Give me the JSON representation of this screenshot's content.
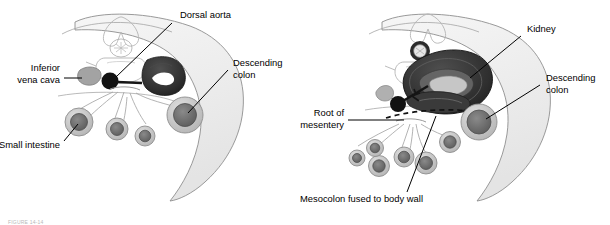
{
  "figure": {
    "caption": "FIGURE 14-14",
    "panels": [
      {
        "id": "left",
        "name": "pre-fusion-cross-section",
        "labels": [
          {
            "name": "dorsal-aorta",
            "text": "Dorsal aorta",
            "line1": "Dorsal aorta",
            "line2": ""
          },
          {
            "name": "inferior-vena-cava",
            "text": "Inferior vena cava",
            "line1": "Inferior",
            "line2": "vena cava"
          },
          {
            "name": "descending-colon",
            "text": "Descending colon",
            "line1": "Descending",
            "line2": "colon"
          },
          {
            "name": "small-intestine",
            "text": "Small intestine",
            "line1": "Small intestine",
            "line2": ""
          }
        ]
      },
      {
        "id": "right",
        "name": "post-fusion-cross-section",
        "labels": [
          {
            "name": "kidney",
            "text": "Kidney",
            "line1": "Kidney",
            "line2": ""
          },
          {
            "name": "descending-colon",
            "text": "Descending colon",
            "line1": "Descending",
            "line2": "colon"
          },
          {
            "name": "root-of-mesentery",
            "text": "Root of mesentery",
            "line1": "Root of",
            "line2": "mesentery"
          },
          {
            "name": "mesocolon-fused",
            "text": "Mesocolon fused to body wall",
            "line1": "Mesocolon fused to body wall",
            "line2": ""
          }
        ]
      }
    ],
    "colors": {
      "background": "#ffffff",
      "outline": "#7a7a7a",
      "body_wall_fill": "#f0f0f0",
      "bone_outline": "#b0b0b0",
      "aorta": "#111111",
      "kidney_dark": "#2e2e2e",
      "kidney_mid": "#4a4a4a",
      "gut_core": "#6e6e6e",
      "gut_ring": "#c4c4c4",
      "vena_cava": "#9a9a9a",
      "label_text": "#000000",
      "leader_line": "#000000"
    }
  }
}
